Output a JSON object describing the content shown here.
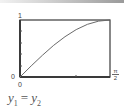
{
  "chart_data": {
    "type": "line",
    "title": "",
    "xlabel": "",
    "ylabel": "",
    "xlim": [
      0,
      1.5708
    ],
    "ylim": [
      0,
      1
    ],
    "x_tick_labels": [
      "0",
      "π/2"
    ],
    "y_tick_labels": [
      "0",
      "1"
    ],
    "grid": false,
    "series": [
      {
        "name": "y1 = y2",
        "function": "sin(x)",
        "x": [
          0,
          0.1963,
          0.3927,
          0.589,
          0.7854,
          0.9817,
          1.1781,
          1.3744,
          1.5708
        ],
        "values": [
          0,
          0.195,
          0.383,
          0.556,
          0.707,
          0.831,
          0.924,
          0.981,
          1.0
        ]
      }
    ],
    "caption": "y1 = y2"
  },
  "labels": {
    "y_top": "1",
    "y_origin": "0",
    "x_origin": "0",
    "x_end_num": "π",
    "x_end_den": "2"
  },
  "caption": {
    "lhs": "y",
    "lhs_sub": "1",
    "eq": "=",
    "rhs": "y",
    "rhs_sub": "2"
  },
  "colors": {
    "frame": "#3a3a3a",
    "curve": "#6a6a6a",
    "text": "#444444"
  }
}
